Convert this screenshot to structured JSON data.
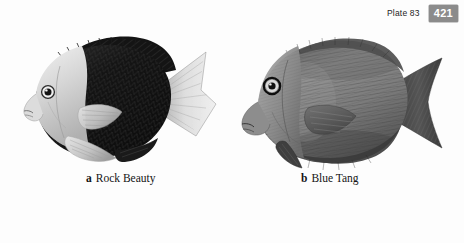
{
  "header": {
    "plate_label": "Plate 83",
    "page_number": "421",
    "badge_bg_color": "#8b8b8b",
    "badge_text_color": "#ffffff"
  },
  "plate": {
    "figures": [
      {
        "letter": "a",
        "common_name": "Rock Beauty",
        "species_icon": "rock-beauty-fish-illustration",
        "rendering": "grayscale-halftone",
        "description": "Pale head and forebody with a large black body block, pale dorsal and caudal fins",
        "body_light_color": "#d8d8d8",
        "body_dark_color": "#171717",
        "fin_color": "#c9c9c9"
      },
      {
        "letter": "b",
        "common_name": "Blue Tang",
        "species_icon": "blue-tang-fish-illustration",
        "rendering": "grayscale-halftone",
        "description": "Oval disc-shaped body in uniform mid-gray with fine vertical striations and a crescent tail",
        "body_light_color": "#9a9a9a",
        "body_dark_color": "#3a3a3a",
        "fin_color": "#4a4a4a"
      }
    ]
  },
  "page": {
    "background_color": "#fdfdfd",
    "text_color": "#141414"
  }
}
